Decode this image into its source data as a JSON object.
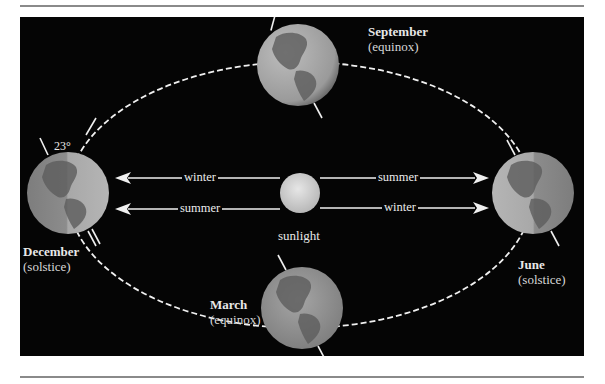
{
  "figure": {
    "colors": {
      "background": "#050505",
      "orbit": "#f0f0f0",
      "arrow": "#f0f0f0",
      "earth_light": "#bdbdbd",
      "earth_dark": "#6f6f6f",
      "sun": "#d9d9d9",
      "rule": "#8a8a8a"
    }
  },
  "positions": {
    "september": {
      "name": "September",
      "type": "(equinox)"
    },
    "december": {
      "name": "December",
      "type": "(solstice)"
    },
    "march": {
      "name": "March",
      "type": "(equinox)"
    },
    "june": {
      "name": "June",
      "type": "(solstice)"
    }
  },
  "sun": {
    "label": "sunlight"
  },
  "arrows": {
    "left_top": "winter",
    "left_bottom": "summer",
    "right_top": "summer",
    "right_bottom": "winter"
  },
  "tilt": {
    "angle_label": "23°"
  }
}
